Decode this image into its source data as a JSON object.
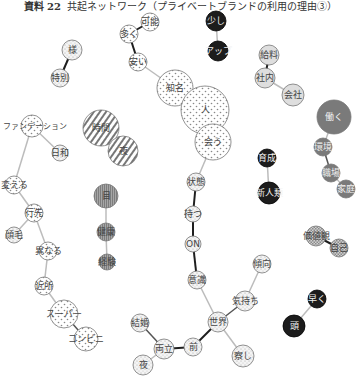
{
  "title": {
    "prefix": "資料 22",
    "text": "共起ネットワーク（プライベートブランドの利用の理由③）"
  },
  "colors": {
    "dots": "#d9d9d9",
    "fine_dots": "#e8e8e8",
    "hatch": "#999999",
    "vertical_stripe": "#8c8c8c",
    "light_gray": "#dcdcdc",
    "dark_gray": "#7a7a7a",
    "black": "#1a1a1a",
    "checker": "#b5b5b5",
    "edge_light": "#bbbbbb",
    "edge_dark": "#222222"
  },
  "nodes": [
    {
      "id": "n_hyo",
      "label": "様",
      "x": 72,
      "y": 50,
      "r": 10,
      "fill": "fine"
    },
    {
      "id": "n_tokubetsu",
      "label": "特別",
      "x": 60,
      "y": 78,
      "r": 9,
      "fill": "fine"
    },
    {
      "id": "n_kanou",
      "label": "可能",
      "x": 150,
      "y": 22,
      "r": 9,
      "fill": "dots"
    },
    {
      "id": "n_ooku",
      "label": "多く",
      "x": 129,
      "y": 34,
      "r": 9,
      "fill": "dots"
    },
    {
      "id": "n_yasui",
      "label": "安い",
      "x": 138,
      "y": 62,
      "r": 9,
      "fill": "dots"
    },
    {
      "id": "n_sukoshi",
      "label": "少し",
      "x": 216,
      "y": 21,
      "r": 10,
      "fill": "black"
    },
    {
      "id": "n_aplus",
      "label": "アップ",
      "x": 218,
      "y": 51,
      "r": 10,
      "fill": "black"
    },
    {
      "id": "n_chishiki",
      "label": "知名",
      "x": 175,
      "y": 88,
      "r": 18,
      "fill": "dots"
    },
    {
      "id": "n_hito",
      "label": "人",
      "x": 205,
      "y": 110,
      "r": 24,
      "fill": "dots"
    },
    {
      "id": "n_au",
      "label": "会う",
      "x": 213,
      "y": 142,
      "r": 18,
      "fill": "dots"
    },
    {
      "id": "n_kyuryo",
      "label": "給料",
      "x": 269,
      "y": 55,
      "r": 10,
      "fill": "light_gray"
    },
    {
      "id": "n_shanai",
      "label": "社内",
      "x": 265,
      "y": 78,
      "r": 10,
      "fill": "light_gray"
    },
    {
      "id": "n_kaisha",
      "label": "会社",
      "x": 293,
      "y": 95,
      "r": 11,
      "fill": "light_gray"
    },
    {
      "id": "n_hataraku",
      "label": "働く",
      "x": 334,
      "y": 117,
      "r": 17,
      "fill": "dark_gray"
    },
    {
      "id": "n_kankyo",
      "label": "環境",
      "x": 323,
      "y": 147,
      "r": 9,
      "fill": "dark_gray"
    },
    {
      "id": "n_shokuba",
      "label": "職場",
      "x": 331,
      "y": 173,
      "r": 9,
      "fill": "dark_gray"
    },
    {
      "id": "n_kasei",
      "label": "家庭",
      "x": 346,
      "y": 189,
      "r": 9,
      "fill": "dark_gray"
    },
    {
      "id": "n_ikusei",
      "label": "育成",
      "x": 267,
      "y": 158,
      "r": 9,
      "fill": "black"
    },
    {
      "id": "n_shinjinrui",
      "label": "新人類",
      "x": 269,
      "y": 193,
      "r": 11,
      "fill": "black"
    },
    {
      "id": "n_jikan",
      "label": "時間",
      "x": 101,
      "y": 128,
      "r": 18,
      "fill": "hatch"
    },
    {
      "id": "n_kyo",
      "label": "夜",
      "x": 123,
      "y": 151,
      "r": 15,
      "fill": "hatch"
    },
    {
      "id": "n_fashion",
      "label": "ファッション",
      "x": 32,
      "y": 126,
      "r": 11,
      "fill": "dots",
      "free_label": "ファンデーション"
    },
    {
      "id": "n_nichiwa",
      "label": "日和",
      "x": 60,
      "y": 153,
      "r": 8,
      "fill": "fine"
    },
    {
      "id": "n_kaeru",
      "label": "変える",
      "x": 14,
      "y": 185,
      "r": 9,
      "fill": "dots"
    },
    {
      "id": "n_yukisaki",
      "label": "行先",
      "x": 34,
      "y": 213,
      "r": 9,
      "fill": "dots"
    },
    {
      "id": "n_moto",
      "label": "顔毛",
      "x": 14,
      "y": 235,
      "r": 8,
      "fill": "fine"
    },
    {
      "id": "n_kotonaru",
      "label": "異なる",
      "x": 48,
      "y": 251,
      "r": 9,
      "fill": "dots"
    },
    {
      "id": "n_kinjo",
      "label": "近所",
      "x": 44,
      "y": 286,
      "r": 9,
      "fill": "dots"
    },
    {
      "id": "n_super",
      "label": "スーパー",
      "x": 64,
      "y": 314,
      "r": 14,
      "fill": "dots"
    },
    {
      "id": "n_combi",
      "label": "コンビニ",
      "x": 86,
      "y": 339,
      "r": 12,
      "fill": "dots"
    },
    {
      "id": "n_me",
      "label": "目",
      "x": 106,
      "y": 196,
      "r": 12,
      "fill": "stripe"
    },
    {
      "id": "n_kenkou",
      "label": "健康",
      "x": 106,
      "y": 232,
      "r": 9,
      "fill": "stripe"
    },
    {
      "id": "n_keiken",
      "label": "経験",
      "x": 107,
      "y": 262,
      "r": 8,
      "fill": "stripe"
    },
    {
      "id": "n_joukyou",
      "label": "状態",
      "x": 196,
      "y": 182,
      "r": 9,
      "fill": "fine"
    },
    {
      "id": "n_tsuzuku",
      "label": "持つ",
      "x": 193,
      "y": 214,
      "r": 8,
      "fill": "fine"
    },
    {
      "id": "n_on",
      "label": "ON",
      "x": 193,
      "y": 244,
      "r": 8,
      "fill": "fine"
    },
    {
      "id": "n_ishiki",
      "label": "意識",
      "x": 197,
      "y": 280,
      "r": 9,
      "fill": "fine"
    },
    {
      "id": "n_kimochi",
      "label": "気持ち",
      "x": 245,
      "y": 301,
      "r": 10,
      "fill": "fine"
    },
    {
      "id": "n_seiken",
      "label": "世界",
      "x": 218,
      "y": 322,
      "r": 10,
      "fill": "fine"
    },
    {
      "id": "n_mae",
      "label": "前",
      "x": 193,
      "y": 347,
      "r": 9,
      "fill": "fine"
    },
    {
      "id": "n_ryoritsu",
      "label": "両立",
      "x": 164,
      "y": 349,
      "r": 10,
      "fill": "fine"
    },
    {
      "id": "n_kekkon",
      "label": "結婚",
      "x": 140,
      "y": 323,
      "r": 9,
      "fill": "fine"
    },
    {
      "id": "n_yoru",
      "label": "夜",
      "x": 143,
      "y": 365,
      "r": 10,
      "fill": "fine"
    },
    {
      "id": "n_sasshi",
      "label": "察し",
      "x": 243,
      "y": 356,
      "r": 11,
      "fill": "fine"
    },
    {
      "id": "n_keikou",
      "label": "傾向",
      "x": 262,
      "y": 264,
      "r": 9,
      "fill": "fine"
    },
    {
      "id": "n_gendai",
      "label": "現代",
      "x": 250,
      "y": 300,
      "r": 7,
      "fill": "none",
      "hidden": true
    },
    {
      "id": "n_kachikan",
      "label": "価値観",
      "x": 316,
      "y": 236,
      "r": 10,
      "fill": "checker"
    },
    {
      "id": "n_jiko",
      "label": "自己",
      "x": 339,
      "y": 248,
      "r": 9,
      "fill": "checker"
    },
    {
      "id": "n_shigoto",
      "label": "早く",
      "x": 317,
      "y": 299,
      "r": 9,
      "fill": "black"
    },
    {
      "id": "n_atama",
      "label": "頭",
      "x": 294,
      "y": 326,
      "r": 11,
      "fill": "black"
    }
  ],
  "edges": [
    {
      "from": "n_hyo",
      "to": "n_tokubetsu",
      "style": "dark"
    },
    {
      "from": "n_kanou",
      "to": "n_ooku",
      "style": "dark"
    },
    {
      "from": "n_ooku",
      "to": "n_yasui",
      "style": "dark"
    },
    {
      "from": "n_yasui",
      "to": "n_chishiki",
      "style": "light"
    },
    {
      "from": "n_sukoshi",
      "to": "n_aplus",
      "style": "light"
    },
    {
      "from": "n_kyuryo",
      "to": "n_shanai",
      "style": "dark"
    },
    {
      "from": "n_shanai",
      "to": "n_kaisha",
      "style": "light"
    },
    {
      "from": "n_hataraku",
      "to": "n_kankyo",
      "style": "light"
    },
    {
      "from": "n_kankyo",
      "to": "n_shokuba",
      "style": "mid"
    },
    {
      "from": "n_shokuba",
      "to": "n_kasei",
      "style": "light"
    },
    {
      "from": "n_ikusei",
      "to": "n_shinjinrui",
      "style": "light"
    },
    {
      "from": "n_au",
      "to": "n_joukyou",
      "style": "light"
    },
    {
      "from": "n_joukyou",
      "to": "n_tsuzuku",
      "style": "dark"
    },
    {
      "from": "n_tsuzuku",
      "to": "n_on",
      "style": "dark"
    },
    {
      "from": "n_on",
      "to": "n_ishiki",
      "style": "dark"
    },
    {
      "from": "n_ishiki",
      "to": "n_seiken",
      "style": "light"
    },
    {
      "from": "n_kimochi",
      "to": "n_seiken",
      "style": "mid"
    },
    {
      "from": "n_seiken",
      "to": "n_mae",
      "style": "dark"
    },
    {
      "from": "n_mae",
      "to": "n_ryoritsu",
      "style": "dark"
    },
    {
      "from": "n_ryoritsu",
      "to": "n_kekkon",
      "style": "mid"
    },
    {
      "from": "n_ryoritsu",
      "to": "n_yoru",
      "style": "light"
    },
    {
      "from": "n_seiken",
      "to": "n_sasshi",
      "style": "light"
    },
    {
      "from": "n_me",
      "to": "n_kenkou",
      "style": "light"
    },
    {
      "from": "n_kenkou",
      "to": "n_keiken",
      "style": "light"
    },
    {
      "from": "n_fashion",
      "to": "n_nichiwa",
      "style": "light"
    },
    {
      "from": "n_fashion",
      "to": "n_kaeru",
      "style": "light"
    },
    {
      "from": "n_kaeru",
      "to": "n_yukisaki",
      "style": "light"
    },
    {
      "from": "n_yukisaki",
      "to": "n_moto",
      "style": "light"
    },
    {
      "from": "n_yukisaki",
      "to": "n_kotonaru",
      "style": "light"
    },
    {
      "from": "n_kotonaru",
      "to": "n_kinjo",
      "style": "light"
    },
    {
      "from": "n_kinjo",
      "to": "n_super",
      "style": "light"
    },
    {
      "from": "n_super",
      "to": "n_combi",
      "style": "mid"
    },
    {
      "from": "n_kachikan",
      "to": "n_jiko",
      "style": "dark"
    },
    {
      "from": "n_shigoto",
      "to": "n_atama",
      "style": "light"
    },
    {
      "from": "n_keikou",
      "to": "n_kimochi",
      "style": "light"
    }
  ]
}
